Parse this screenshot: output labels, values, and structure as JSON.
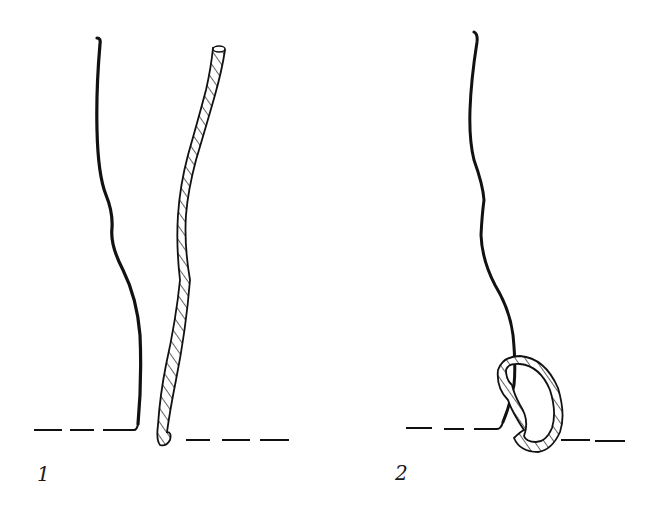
{
  "figures": [
    {
      "id": "1",
      "label": "1",
      "description": "Straight untwisted fiber and twisted fiber standing near a dashed baseline"
    },
    {
      "id": "2",
      "label": "2",
      "description": "Fiber with twisted strand looped around its base at the dashed baseline"
    }
  ],
  "colors": {
    "ink": "#111111",
    "background": "#ffffff"
  }
}
